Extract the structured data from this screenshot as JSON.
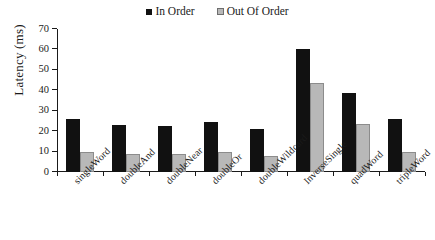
{
  "chart_data": {
    "type": "bar",
    "title": "",
    "xlabel": "",
    "ylabel": "Latency (ms)",
    "ylim": [
      0,
      70
    ],
    "yticks": [
      0,
      10,
      20,
      30,
      40,
      50,
      60,
      70
    ],
    "grid": false,
    "legend_position": "top-center",
    "categories": [
      "singleWord",
      "doubleAnd",
      "doubleNear",
      "doubleOr",
      "doubleWildcard",
      "InverseSingle",
      "quadWord",
      "tripleWord"
    ],
    "series": [
      {
        "name": "In Order",
        "color": "#111111",
        "values": [
          26,
          23,
          22.5,
          24.5,
          21,
          60,
          38.5,
          26
        ]
      },
      {
        "name": "Out Of Order",
        "color": "#b8b8b8",
        "values": [
          10,
          9,
          9,
          10,
          8,
          43.5,
          23.5,
          10
        ]
      }
    ]
  },
  "legend": {
    "entries": [
      {
        "label": "In Order",
        "swatch": "black-square-icon"
      },
      {
        "label": "Out Of Order",
        "swatch": "gray-square-icon"
      }
    ]
  },
  "axes": {
    "y_title": "Latency (ms)",
    "y_tick_labels": [
      "70",
      "60",
      "50",
      "40",
      "30",
      "20",
      "10",
      "0"
    ]
  }
}
